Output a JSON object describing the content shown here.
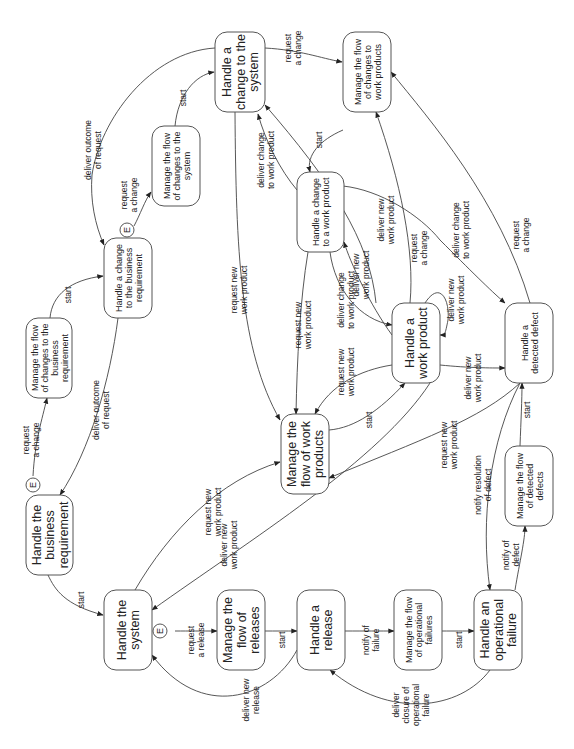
{
  "diagram": {
    "orientation": "rotated-90-ccw",
    "nodes": [
      {
        "id": "n1",
        "lines": [
          "Handle a",
          "change to the",
          "system"
        ],
        "size": "lg",
        "x": 215,
        "y": 32,
        "w": 50,
        "h": 80
      },
      {
        "id": "n2",
        "lines": [
          "Manage the flow",
          "of changes to",
          "work products"
        ],
        "size": "sm",
        "x": 343,
        "y": 32,
        "w": 48,
        "h": 80
      },
      {
        "id": "n3",
        "lines": [
          "Manage the flow",
          "of changes to the",
          "system"
        ],
        "size": "sm",
        "x": 152,
        "y": 126,
        "w": 48,
        "h": 80
      },
      {
        "id": "n4",
        "lines": [
          "Handle a change",
          "to a work product"
        ],
        "size": "sm",
        "x": 297,
        "y": 172,
        "w": 47,
        "h": 80
      },
      {
        "id": "n5",
        "lines": [
          "Handle a change",
          "to the business",
          "requirement"
        ],
        "size": "sm",
        "x": 104,
        "y": 238,
        "w": 48,
        "h": 80
      },
      {
        "id": "n6",
        "lines": [
          "Manage the flow",
          "of changes to the",
          "business",
          "requirement"
        ],
        "size": "sm",
        "x": 26,
        "y": 318,
        "w": 46,
        "h": 80
      },
      {
        "id": "n7",
        "lines": [
          "Handle a",
          "work product"
        ],
        "size": "lg",
        "x": 392,
        "y": 303,
        "w": 48,
        "h": 80
      },
      {
        "id": "n8",
        "lines": [
          "Handle a",
          "detected defect"
        ],
        "size": "sm",
        "x": 505,
        "y": 303,
        "w": 48,
        "h": 80
      },
      {
        "id": "n9",
        "lines": [
          "Manage the",
          "flow of work",
          "products"
        ],
        "size": "lg",
        "x": 281,
        "y": 414,
        "w": 48,
        "h": 80
      },
      {
        "id": "n10",
        "lines": [
          "Manage the flow",
          "of detected",
          "defects"
        ],
        "size": "sm",
        "x": 505,
        "y": 446,
        "w": 48,
        "h": 80
      },
      {
        "id": "n11",
        "lines": [
          "Handle the",
          "business",
          "requirement"
        ],
        "size": "lg",
        "x": 26,
        "y": 495,
        "w": 47,
        "h": 80
      },
      {
        "id": "n12",
        "lines": [
          "Handle the",
          "system"
        ],
        "size": "lg",
        "x": 104,
        "y": 590,
        "w": 48,
        "h": 80
      },
      {
        "id": "n13",
        "lines": [
          "Manage the",
          "flow of",
          "releases"
        ],
        "size": "lg",
        "x": 217,
        "y": 590,
        "w": 48,
        "h": 80
      },
      {
        "id": "n14",
        "lines": [
          "Handle a",
          "release"
        ],
        "size": "lg",
        "x": 297,
        "y": 590,
        "w": 48,
        "h": 80
      },
      {
        "id": "n15",
        "lines": [
          "Manage the flow",
          "of operational",
          "failures"
        ],
        "size": "sm",
        "x": 394,
        "y": 590,
        "w": 48,
        "h": 80
      },
      {
        "id": "n16",
        "lines": [
          "Handle an",
          "operational",
          "failure"
        ],
        "size": "lg",
        "x": 474,
        "y": 590,
        "w": 48,
        "h": 80
      }
    ],
    "event_markers": [
      {
        "id": "e1",
        "label": "E",
        "cx": 127,
        "cy": 230
      },
      {
        "id": "e2",
        "label": "E",
        "cx": 33,
        "cy": 485
      },
      {
        "id": "e3",
        "label": "E",
        "cx": 160,
        "cy": 631
      }
    ],
    "edges": [
      {
        "id": "a1",
        "path": "M265,48 C300,50 320,58 342,62",
        "label": [
          "request",
          "a change"
        ],
        "lx": 292,
        "ly": 48
      },
      {
        "id": "a2",
        "path": "M175,126 C178,95 195,75 214,72",
        "label": [
          "start"
        ],
        "lx": 182,
        "ly": 98
      },
      {
        "id": "a3",
        "path": "M134,226 C140,215 145,200 151,192",
        "label": [
          "request",
          "a change"
        ],
        "lx": 128,
        "ly": 195
      },
      {
        "id": "a4",
        "path": "M215,48 C150,52 100,120 92,175 C90,200 95,225 104,245",
        "label": [
          "deliver outcome",
          "of request"
        ],
        "lx": 92,
        "ly": 150
      },
      {
        "id": "a5",
        "path": "M50,318 C52,295 70,280 103,276",
        "label": [
          "start"
        ],
        "lx": 67,
        "ly": 295
      },
      {
        "id": "a6",
        "path": "M33,476 C35,440 42,420 47,398",
        "label": [
          "request",
          "a change"
        ],
        "lx": 30,
        "ly": 440
      },
      {
        "id": "a7",
        "path": "M118,318 C110,380 90,450 60,495",
        "label": [
          "deliver outcome",
          "of request"
        ],
        "lx": 100,
        "ly": 410
      },
      {
        "id": "a8",
        "path": "M48,575 C55,590 65,605 103,615",
        "label": [
          "start"
        ],
        "lx": 80,
        "ly": 600
      },
      {
        "id": "a9",
        "path": "M235,112 C236,250 240,350 280,420",
        "label": [
          "request new",
          "work product"
        ],
        "lx": 238,
        "ly": 290
      },
      {
        "id": "a10",
        "path": "M297,190 C280,170 265,140 258,114",
        "label": [
          "deliver change",
          "to work product"
        ],
        "lx": 265,
        "ly": 160
      },
      {
        "id": "a11",
        "path": "M343,130 C320,140 306,155 310,172",
        "label": [
          "start"
        ],
        "lx": 318,
        "ly": 140
      },
      {
        "id": "a12",
        "path": "M343,186 C380,190 420,215 440,240 C470,270 490,290 505,303",
        "label": [
          "deliver change",
          "to work product"
        ],
        "lx": 460,
        "ly": 230
      },
      {
        "id": "a13",
        "path": "M376,303 C370,240 330,180 265,105",
        "label": [
          "deliver new",
          "work product"
        ],
        "lx": 385,
        "ly": 220
      },
      {
        "id": "a14",
        "path": "M410,303 C415,250 400,180 376,112",
        "label": [
          "request",
          "a change"
        ],
        "lx": 418,
        "ly": 248
      },
      {
        "id": "a15",
        "path": "M530,303 C500,200 430,120 391,72",
        "label": [
          "request",
          "a change"
        ],
        "lx": 520,
        "ly": 235
      },
      {
        "id": "a16",
        "path": "M392,335 C370,305 350,262 344,242",
        "label": [
          "deliver new",
          "work product"
        ],
        "lx": 360,
        "ly": 275
      },
      {
        "id": "a17",
        "path": "M330,252 C335,290 360,320 392,325",
        "label": [
          "deliver change",
          "to work product"
        ],
        "lx": 345,
        "ly": 300
      },
      {
        "id": "a18",
        "path": "M425,303 C440,280 450,300 448,320 C445,335 445,335 440,335",
        "label": [
          "deliver new",
          "work product"
        ],
        "lx": 455,
        "ly": 300
      },
      {
        "id": "a19",
        "path": "M308,252 C300,300 297,360 296,414",
        "label": [
          "request new",
          "work product"
        ],
        "lx": 302,
        "ly": 325
      },
      {
        "id": "a20",
        "path": "M392,365 C360,370 330,385 315,414",
        "label": [
          "request new",
          "work product"
        ],
        "lx": 345,
        "ly": 372
      },
      {
        "id": "a21",
        "path": "M329,430 C355,428 380,410 405,383",
        "label": [
          "start"
        ],
        "lx": 368,
        "ly": 420
      },
      {
        "id": "a22",
        "path": "M440,365 C470,368 490,368 505,368",
        "label": [
          "deliver new",
          "work product"
        ],
        "lx": 472,
        "ly": 378
      },
      {
        "id": "a23",
        "path": "M520,383 C480,420 420,440 329,478",
        "label": [
          "request new",
          "work product"
        ],
        "lx": 448,
        "ly": 445
      },
      {
        "id": "a24",
        "path": "M520,446 C521,420 522,400 522,383",
        "label": [
          "start"
        ],
        "lx": 526,
        "ly": 410
      },
      {
        "id": "a25",
        "path": "M520,383 C490,440 480,520 490,590",
        "label": [
          "notify resolution",
          "of defect"
        ],
        "lx": 482,
        "ly": 485
      },
      {
        "id": "a26",
        "path": "M515,590 C520,560 525,540 525,526",
        "label": [
          "notify of",
          "defect"
        ],
        "lx": 510,
        "ly": 555
      },
      {
        "id": "a27",
        "path": "M430,383 C380,460 250,540 152,610",
        "label": [
          "deliver new",
          "work product"
        ],
        "lx": 228,
        "ly": 545
      },
      {
        "id": "a28",
        "path": "M135,590 C170,530 220,480 280,462",
        "label": [
          "request new",
          "work product"
        ],
        "lx": 212,
        "ly": 512
      },
      {
        "id": "a29",
        "path": "M175,631 C190,631 200,631 217,631",
        "label": [
          "request",
          "a release"
        ],
        "lx": 195,
        "ly": 640
      },
      {
        "id": "a30",
        "path": "M265,631 C275,631 285,631 297,631",
        "label": [
          "start"
        ],
        "lx": 281,
        "ly": 640
      },
      {
        "id": "a31",
        "path": "M297,650 C270,700 200,720 152,655",
        "label": [
          "deliver new",
          "release"
        ],
        "lx": 250,
        "ly": 700
      },
      {
        "id": "a32",
        "path": "M345,631 C365,631 380,631 394,631",
        "label": [
          "notify of",
          "failure"
        ],
        "lx": 370,
        "ly": 640
      },
      {
        "id": "a33",
        "path": "M442,631 C455,631 463,631 474,631",
        "label": [
          "start"
        ],
        "lx": 458,
        "ly": 640
      },
      {
        "id": "a34",
        "path": "M490,670 C460,710 390,720 330,670",
        "label": [
          "deliver",
          "closure of",
          "operational",
          "failure"
        ],
        "lx": 410,
        "ly": 705
      }
    ]
  }
}
